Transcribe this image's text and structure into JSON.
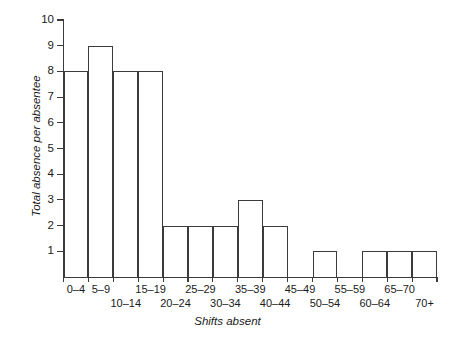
{
  "chart_data": {
    "type": "bar",
    "title": "",
    "xlabel": "Shifts absent",
    "ylabel": "Total absence per absentee",
    "categories": [
      "0–4",
      "5–9",
      "10–14",
      "15–19",
      "20–24",
      "25–29",
      "30–34",
      "35–39",
      "40–44",
      "45–49",
      "50–54",
      "55–59",
      "60–64",
      "65–70",
      "70+"
    ],
    "values": [
      8,
      9,
      8,
      8,
      2,
      2,
      2,
      3,
      2,
      0,
      1,
      0,
      1,
      1,
      1
    ],
    "ylim": [
      0,
      10
    ],
    "xlim": [
      0,
      15
    ],
    "yticks": [
      1,
      2,
      3,
      4,
      5,
      6,
      7,
      8,
      9,
      10
    ],
    "ytick_labels": [
      "1",
      "2",
      "3",
      "4",
      "5",
      "6",
      "7",
      "8",
      "9",
      "10"
    ],
    "grid": false,
    "legend": false,
    "legend_position": "none",
    "bar_fill": "none",
    "bar_edge_color": "#3b3b3b",
    "axis_color": "#3b3b3b",
    "background": "#ffffff"
  },
  "axes": {
    "y_title": "Total absence per absentee",
    "x_title": "Shifts absent"
  },
  "x_labels": [
    {
      "text": "0–4",
      "row": "top"
    },
    {
      "text": "5–9",
      "row": "top"
    },
    {
      "text": "10–14",
      "row": "bottom"
    },
    {
      "text": "15–19",
      "row": "top"
    },
    {
      "text": "20–24",
      "row": "bottom"
    },
    {
      "text": "25–29",
      "row": "top"
    },
    {
      "text": "30–34",
      "row": "bottom"
    },
    {
      "text": "35–39",
      "row": "top"
    },
    {
      "text": "40–44",
      "row": "bottom"
    },
    {
      "text": "45–49",
      "row": "top"
    },
    {
      "text": "50–54",
      "row": "bottom"
    },
    {
      "text": "55–59",
      "row": "top"
    },
    {
      "text": "60–64",
      "row": "bottom"
    },
    {
      "text": "65–70",
      "row": "top"
    },
    {
      "text": "70+",
      "row": "bottom"
    }
  ]
}
